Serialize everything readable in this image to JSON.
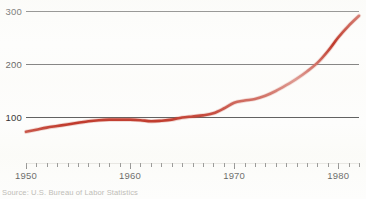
{
  "figure": {
    "background_color": "#fdfdfc",
    "source_note": "Source: U.S. Bureau of Labor Statistics"
  },
  "chart_data": {
    "type": "line",
    "title": "",
    "subtitle": "",
    "xlabel": "",
    "ylabel": "",
    "xlim": [
      1950,
      1982
    ],
    "ylim": [
      0,
      300
    ],
    "grid": true,
    "grid_axis": "y",
    "legend": false,
    "legend_position": "none",
    "series": [
      {
        "name": "Index",
        "color": "#c0392b",
        "line_width": 2.6,
        "x": [
          1950,
          1951,
          1952,
          1953,
          1954,
          1955,
          1956,
          1957,
          1958,
          1959,
          1960,
          1961,
          1962,
          1963,
          1964,
          1965,
          1966,
          1967,
          1968,
          1969,
          1970,
          1971,
          1972,
          1973,
          1974,
          1975,
          1976,
          1977,
          1978,
          1979,
          1980,
          1981,
          1982
        ],
        "values": [
          72,
          76,
          80,
          83,
          86,
          89,
          92,
          94,
          95,
          95,
          95,
          94,
          92,
          93,
          95,
          99,
          101,
          103,
          107,
          116,
          127,
          131,
          134,
          140,
          149,
          160,
          172,
          186,
          202,
          224,
          250,
          272,
          291
        ]
      }
    ],
    "y_ticks": [
      100,
      200,
      300
    ],
    "y_tick_labels": [
      "100",
      "200",
      "300"
    ],
    "x_major_ticks": [
      1950,
      1960,
      1970,
      1980
    ],
    "x_major_tick_labels": [
      "1950",
      "1960",
      "1970",
      "1980"
    ],
    "x_minor_tick_step": 1,
    "axis_color": "#575757"
  }
}
